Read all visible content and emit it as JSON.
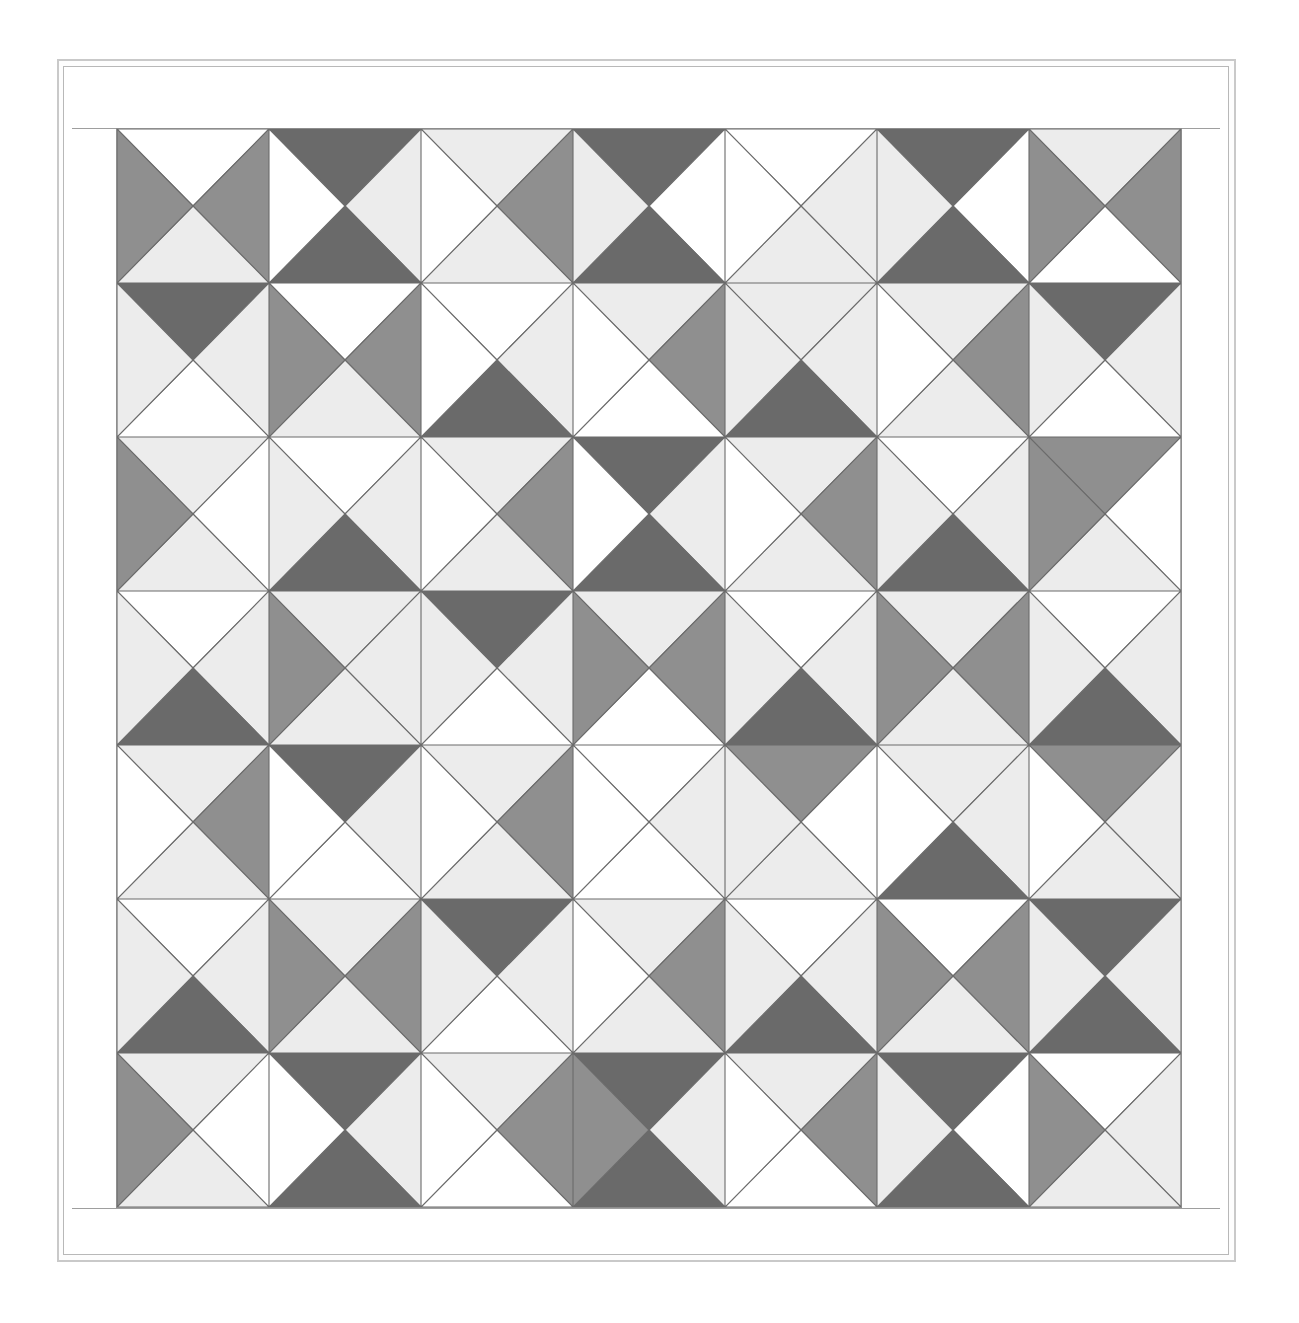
{
  "artwork": {
    "title": "Hourglass Quarter-Square Triangle Quilt",
    "grid": {
      "rows": 7,
      "cols": 7
    },
    "palette": {
      "white": "#ffffff",
      "light": "#ececec",
      "medium": "#8f8f8f",
      "dark": "#6a6a6a",
      "line": "#6b6b6b",
      "border_line": "#b8b8b8",
      "background": "#ffffff"
    },
    "border": {
      "outer_stroke": "#c9c9c9",
      "inner_stroke": "#b8b8b8",
      "sashing_stroke": "#9e9e9e"
    },
    "blocks": [
      [
        {
          "top": "white",
          "right": "medium",
          "bottom": "light",
          "left": "medium"
        },
        {
          "top": "dark",
          "right": "light",
          "bottom": "dark",
          "left": "white"
        },
        {
          "top": "light",
          "right": "medium",
          "bottom": "light",
          "left": "white"
        },
        {
          "top": "dark",
          "right": "white",
          "bottom": "dark",
          "left": "light"
        },
        {
          "top": "white",
          "right": "light",
          "bottom": "light",
          "left": "white"
        },
        {
          "top": "dark",
          "right": "white",
          "bottom": "dark",
          "left": "light"
        },
        {
          "top": "light",
          "right": "medium",
          "bottom": "white",
          "left": "medium"
        }
      ],
      [
        {
          "top": "dark",
          "right": "light",
          "bottom": "white",
          "left": "light"
        },
        {
          "top": "white",
          "right": "medium",
          "bottom": "light",
          "left": "medium"
        },
        {
          "top": "white",
          "right": "light",
          "bottom": "dark",
          "left": "white"
        },
        {
          "top": "light",
          "right": "medium",
          "bottom": "white",
          "left": "white"
        },
        {
          "top": "light",
          "right": "light",
          "bottom": "dark",
          "left": "light"
        },
        {
          "top": "light",
          "right": "medium",
          "bottom": "light",
          "left": "white"
        },
        {
          "top": "dark",
          "right": "light",
          "bottom": "white",
          "left": "light"
        }
      ],
      [
        {
          "top": "light",
          "right": "white",
          "bottom": "light",
          "left": "medium"
        },
        {
          "top": "white",
          "right": "light",
          "bottom": "dark",
          "left": "light"
        },
        {
          "top": "light",
          "right": "medium",
          "bottom": "light",
          "left": "white"
        },
        {
          "top": "dark",
          "right": "light",
          "bottom": "dark",
          "left": "white"
        },
        {
          "top": "light",
          "right": "medium",
          "bottom": "light",
          "left": "white"
        },
        {
          "top": "white",
          "right": "light",
          "bottom": "dark",
          "left": "light"
        },
        {
          "top": "medium",
          "right": "white",
          "bottom": "light",
          "left": "medium"
        }
      ],
      [
        {
          "top": "white",
          "right": "light",
          "bottom": "dark",
          "left": "light"
        },
        {
          "top": "light",
          "right": "light",
          "bottom": "light",
          "left": "medium"
        },
        {
          "top": "dark",
          "right": "light",
          "bottom": "white",
          "left": "light"
        },
        {
          "top": "light",
          "right": "medium",
          "bottom": "white",
          "left": "medium"
        },
        {
          "top": "white",
          "right": "light",
          "bottom": "dark",
          "left": "light"
        },
        {
          "top": "light",
          "right": "medium",
          "bottom": "light",
          "left": "medium"
        },
        {
          "top": "white",
          "right": "light",
          "bottom": "dark",
          "left": "light"
        }
      ],
      [
        {
          "top": "light",
          "right": "medium",
          "bottom": "light",
          "left": "white"
        },
        {
          "top": "dark",
          "right": "light",
          "bottom": "white",
          "left": "white"
        },
        {
          "top": "light",
          "right": "medium",
          "bottom": "light",
          "left": "white"
        },
        {
          "top": "white",
          "right": "light",
          "bottom": "white",
          "left": "white"
        },
        {
          "top": "medium",
          "right": "white",
          "bottom": "light",
          "left": "light"
        },
        {
          "top": "light",
          "right": "light",
          "bottom": "dark",
          "left": "white"
        },
        {
          "top": "medium",
          "right": "light",
          "bottom": "light",
          "left": "white"
        }
      ],
      [
        {
          "top": "white",
          "right": "light",
          "bottom": "dark",
          "left": "light"
        },
        {
          "top": "light",
          "right": "medium",
          "bottom": "light",
          "left": "medium"
        },
        {
          "top": "dark",
          "right": "light",
          "bottom": "white",
          "left": "light"
        },
        {
          "top": "light",
          "right": "medium",
          "bottom": "light",
          "left": "white"
        },
        {
          "top": "white",
          "right": "light",
          "bottom": "dark",
          "left": "light"
        },
        {
          "top": "white",
          "right": "medium",
          "bottom": "light",
          "left": "medium"
        },
        {
          "top": "dark",
          "right": "light",
          "bottom": "dark",
          "left": "light"
        }
      ],
      [
        {
          "top": "light",
          "right": "white",
          "bottom": "light",
          "left": "medium"
        },
        {
          "top": "dark",
          "right": "light",
          "bottom": "dark",
          "left": "white"
        },
        {
          "top": "light",
          "right": "medium",
          "bottom": "white",
          "left": "white"
        },
        {
          "top": "dark",
          "right": "light",
          "bottom": "dark",
          "left": "medium"
        },
        {
          "top": "light",
          "right": "medium",
          "bottom": "white",
          "left": "white"
        },
        {
          "top": "dark",
          "right": "white",
          "bottom": "dark",
          "left": "light"
        },
        {
          "top": "white",
          "right": "light",
          "bottom": "light",
          "left": "medium"
        }
      ]
    ]
  }
}
